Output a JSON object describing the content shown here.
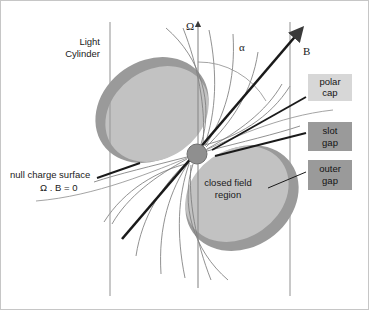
{
  "figure": {
    "background_color": "#ffffff"
  },
  "colors": {
    "closed_field_fill": "#c2c2c2",
    "gap_rim": "#9a9a9a",
    "star_fill": "#8f8f8f",
    "polar_cap_box": "#d7d7d7",
    "gap_box": "#9a9a9a",
    "axis_line": "#8a8a8a",
    "field_line": "#7d7d7d",
    "heavy_line": "#1a1a1a",
    "border": "#b9b9b9"
  },
  "axes": {
    "omega_label": "Ω",
    "b_label": "B",
    "alpha_label": "α"
  },
  "labels": {
    "light_cylinder_line1": "Light",
    "light_cylinder_line2": "Cylinder",
    "null_charge_line1": "null charge surface",
    "null_charge_line2": "Ω . B = 0",
    "closed_field_line1": "closed field",
    "closed_field_line2": "region"
  },
  "boxes": [
    {
      "id": "polar-cap",
      "line1": "polar",
      "line2": "cap",
      "fill": "#d7d7d7",
      "x": 308,
      "y": 74,
      "w": 44,
      "h": 27
    },
    {
      "id": "slot-gap",
      "line1": "slot",
      "line2": "gap",
      "fill": "#9a9a9a",
      "x": 308,
      "y": 122,
      "w": 44,
      "h": 29
    },
    {
      "id": "outer-gap",
      "line1": "outer",
      "line2": "gap",
      "fill": "#9a9a9a",
      "x": 308,
      "y": 160,
      "w": 44,
      "h": 30
    }
  ],
  "geometry": {
    "star_center_x": 197,
    "star_center_y": 154,
    "star_radius": 10,
    "light_cylinder_left_x": 110,
    "light_cylinder_right_x": 290,
    "omega_axis_x": 198,
    "magnetic_axis_angle_deg": 55
  }
}
